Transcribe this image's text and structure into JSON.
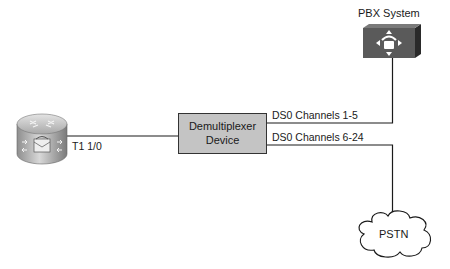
{
  "diagram": {
    "nodes": {
      "router": {
        "label": "T1 1/0",
        "type": "voice-router"
      },
      "demux": {
        "line1": "Demultiplexer",
        "line2": "Device",
        "type": "demultiplexer"
      },
      "pbx": {
        "label": "PBX System",
        "type": "pbx"
      },
      "pstn": {
        "label": "PSTN",
        "type": "cloud"
      }
    },
    "links": [
      {
        "from": "router",
        "to": "demux",
        "label": "T1 1/0"
      },
      {
        "from": "demux",
        "to": "pbx",
        "label": "DS0 Channels 1-5"
      },
      {
        "from": "demux",
        "to": "pstn",
        "label": "DS0 Channels 6-24"
      }
    ],
    "colors": {
      "line": "#1a1a1a",
      "demux_fill": "#c4c4c4",
      "pbx_fill": "#5a5a5a",
      "router_fill": "#b8b8b8"
    }
  }
}
